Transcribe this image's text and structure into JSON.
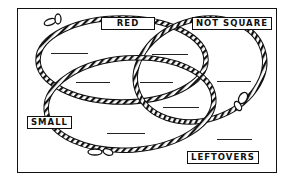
{
  "diagram": {
    "type": "venn",
    "sets": [
      {
        "id": "red",
        "label": "RED"
      },
      {
        "id": "not_square",
        "label": "NOT SQUARE"
      },
      {
        "id": "small",
        "label": "SMALL"
      }
    ],
    "outside_label": "LEFTOVERS",
    "blanks_count": 8,
    "colors": {
      "ink": "#111111",
      "background": "#ffffff"
    }
  }
}
